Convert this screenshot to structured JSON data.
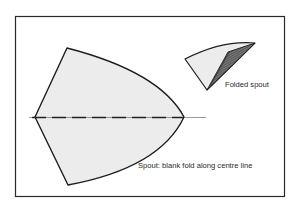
{
  "figure": {
    "labels": {
      "folded_spout": "Folded spout",
      "spout_caption": "Spout: blank fold along centre line"
    },
    "colors": {
      "fill": "#ececec",
      "stroke": "#1e1e1e",
      "frame": "#2a2a2a",
      "hatch": "#4a4a4a"
    },
    "elements": {
      "frame": "rectangular border",
      "spout_blank": "curved kite-shaped blank with dashed centre fold line",
      "folded_spout": "folded cone segment with hatched inner fold"
    }
  }
}
